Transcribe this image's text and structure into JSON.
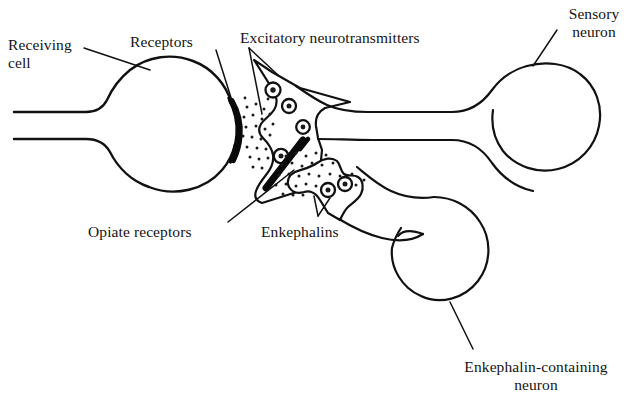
{
  "figure": {
    "type": "biological-diagram",
    "background_color": "#ffffff",
    "stroke_color": "#111111"
  },
  "labels": {
    "receiving_cell": "Receiving\ncell",
    "receptors": "Receptors",
    "excitatory_neurotransmitters": "Excitatory neurotransmitters",
    "sensory_neuron": "Sensory\nneuron",
    "opiate_receptors": "Opiate receptors",
    "enkephalins": "Enkephalins",
    "enkephalin_containing_neuron": "Enkephalin-containing\nneuron"
  },
  "structures": [
    {
      "name": "receiving-cell-body",
      "description": "large circle at left with tapering axon extending to left edge"
    },
    {
      "name": "receptor-band",
      "description": "thick black crescent on right edge of receiving cell"
    },
    {
      "name": "sensory-neuron-terminal",
      "description": "irregular presynaptic terminal containing vesicles"
    },
    {
      "name": "sensory-neuron-axon",
      "description": "horizontal axon running to the right"
    },
    {
      "name": "sensory-neuron-body",
      "description": "large circle at upper right"
    },
    {
      "name": "enkephalin-neuron-terminal",
      "description": "small irregular terminal with two vesicles"
    },
    {
      "name": "enkephalin-neuron-axon",
      "description": "axon descending to lower right"
    },
    {
      "name": "enkephalin-neuron-body",
      "description": "circle at lower right"
    },
    {
      "name": "opiate-receptor-band",
      "description": "thick black band between sensory terminal and enkephalin terminal"
    },
    {
      "name": "neurotransmitter-dots",
      "description": "stippled dots in synaptic cleft"
    },
    {
      "name": "enkephalin-dots",
      "description": "stippled dots in enkephalin synaptic cleft"
    }
  ],
  "counts": {
    "sensory_vesicles": 4,
    "enkephalin_vesicles": 2
  }
}
